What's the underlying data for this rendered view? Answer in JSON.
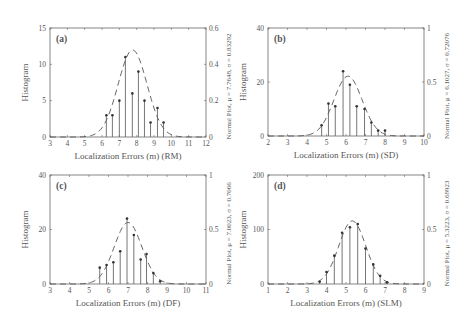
{
  "figure": {
    "width": 474,
    "height": 322,
    "colors": {
      "axis": "#666666",
      "stem": "#666666",
      "curve": "#555555",
      "text": "#555555",
      "background": "#ffffff"
    }
  },
  "chart_data": [
    {
      "type": "bar",
      "subtype": "stem-histogram-with-normal-fit",
      "panel_label": "(a)",
      "xlabel": "Localization Errors (m) (RM)",
      "ylabel": "Histogram",
      "y2label": "Normal Plot, μ = 7.7648, σ = 0.83292",
      "xlim": [
        3,
        12
      ],
      "xticks": [
        3,
        4,
        5,
        6,
        7,
        8,
        9,
        10,
        11,
        12
      ],
      "ylim": [
        0,
        15
      ],
      "yticks": [
        0,
        5,
        10,
        15
      ],
      "y2lim": [
        0,
        0.6
      ],
      "y2ticks": [
        "0",
        "0.2",
        "0.4",
        "0.6"
      ],
      "y2tick_values": [
        0,
        0.2,
        0.4,
        0.6
      ],
      "normal": {
        "mu": 7.7648,
        "sigma": 0.83292
      },
      "x": [
        6.25,
        6.6,
        7.0,
        7.35,
        7.75,
        8.1,
        8.45,
        8.8,
        9.2,
        9.55
      ],
      "values": [
        3,
        3,
        5,
        11,
        6,
        9,
        5,
        2,
        4,
        2
      ],
      "box": {
        "left": 50,
        "top": 28,
        "right": 206,
        "bottom": 137
      }
    },
    {
      "type": "bar",
      "subtype": "stem-histogram-with-normal-fit",
      "panel_label": "(b)",
      "xlabel": "Localization Errors (m) (SD)",
      "ylabel": "Histogram",
      "y2label": "Normal Plot, μ = 6.1027, σ = 0.72076",
      "xlim": [
        2,
        10
      ],
      "xticks": [
        2,
        3,
        4,
        5,
        6,
        7,
        8,
        9,
        10
      ],
      "ylim": [
        0,
        40
      ],
      "yticks": [
        0,
        20,
        40
      ],
      "y2lim": [
        0,
        1
      ],
      "y2ticks": [
        "0",
        "0.5",
        "1"
      ],
      "y2tick_values": [
        0,
        0.5,
        1
      ],
      "normal": {
        "mu": 6.1027,
        "sigma": 0.72076
      },
      "x": [
        4.75,
        5.1,
        5.45,
        5.85,
        6.2,
        6.55,
        6.95,
        7.3,
        7.65,
        8.0
      ],
      "values": [
        4,
        12,
        11,
        24,
        19,
        11,
        10,
        5,
        2,
        2
      ],
      "box": {
        "left": 268,
        "top": 28,
        "right": 424,
        "bottom": 136
      }
    },
    {
      "type": "bar",
      "subtype": "stem-histogram-with-normal-fit",
      "panel_label": "(c)",
      "xlabel": "Localization Errors (m) (DF)",
      "ylabel": "Histogram",
      "y2label": "Normal Plot, μ = 7.0023, σ = 0.7066",
      "xlim": [
        3,
        11
      ],
      "xticks": [
        3,
        4,
        5,
        6,
        7,
        8,
        9,
        10,
        11
      ],
      "ylim": [
        0,
        40
      ],
      "yticks": [
        0,
        20,
        40
      ],
      "y2lim": [
        0,
        1
      ],
      "y2ticks": [
        "0",
        "0.5",
        "1"
      ],
      "y2tick_values": [
        0,
        0.5,
        1
      ],
      "normal": {
        "mu": 7.0023,
        "sigma": 0.7066
      },
      "x": [
        5.55,
        5.9,
        6.25,
        6.6,
        6.95,
        7.3,
        7.65,
        7.95,
        8.3,
        8.65
      ],
      "values": [
        6,
        7,
        8,
        12,
        24,
        18,
        9,
        11,
        4,
        1
      ],
      "box": {
        "left": 50,
        "top": 175,
        "right": 206,
        "bottom": 284
      }
    },
    {
      "type": "bar",
      "subtype": "stem-histogram-with-normal-fit",
      "panel_label": "(d)",
      "xlabel": "Localization Errors (m) (SLM)",
      "ylabel": "Histogram",
      "y2label": "Normal Plot, μ = 5.3223, σ = 0.68923",
      "xlim": [
        1,
        9
      ],
      "xticks": [
        1,
        2,
        3,
        4,
        5,
        6,
        7,
        8,
        9
      ],
      "ylim": [
        0,
        200
      ],
      "yticks": [
        0,
        100,
        200
      ],
      "y2lim": [
        0,
        1
      ],
      "y2ticks": [
        "0",
        "0.5",
        "1"
      ],
      "y2tick_values": [
        0,
        0.5,
        1
      ],
      "normal": {
        "mu": 5.3223,
        "sigma": 0.68923
      },
      "x": [
        3.65,
        4.0,
        4.4,
        4.8,
        5.2,
        5.6,
        6.0,
        6.4,
        6.75,
        7.1
      ],
      "values": [
        4,
        22,
        52,
        94,
        104,
        110,
        65,
        36,
        15,
        3
      ],
      "box": {
        "left": 268,
        "top": 175,
        "right": 424,
        "bottom": 284
      }
    }
  ]
}
